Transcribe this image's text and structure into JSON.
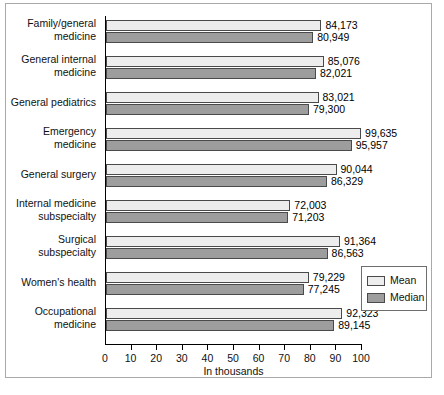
{
  "figure": {
    "x_axis_title": "In thousands",
    "legend": {
      "mean_label": "Mean",
      "median_label": "Median"
    },
    "colors": {
      "mean": "#ededed",
      "median": "#9d9d9d",
      "axis": "#000000",
      "border": "#a9a9a9"
    }
  },
  "chart_data": {
    "type": "bar",
    "orientation": "horizontal",
    "title": "",
    "xlabel": "In thousands",
    "ylabel": "",
    "xlim": [
      0,
      100
    ],
    "xticks": [
      0,
      10,
      20,
      30,
      40,
      50,
      60,
      70,
      80,
      90,
      100
    ],
    "xtick_labels": [
      "0",
      "10",
      "20",
      "30",
      "40",
      "50",
      "60",
      "70",
      "80",
      "90",
      "100"
    ],
    "grid": false,
    "legend_position": "right-lower",
    "units": "thousands of dollars",
    "categories": [
      "Family/general medicine",
      "General internal medicine",
      "General pediatrics",
      "Emergency medicine",
      "General surgery",
      "Internal medicine subspecialty",
      "Surgical subspecialty",
      "Women's health",
      "Occupational medicine"
    ],
    "category_lines": [
      [
        "Family/general",
        "medicine"
      ],
      [
        "General internal",
        "medicine"
      ],
      [
        "General pediatrics"
      ],
      [
        "Emergency",
        "medicine"
      ],
      [
        "General surgery"
      ],
      [
        "Internal medicine",
        "subspecialty"
      ],
      [
        "Surgical",
        "subspecialty"
      ],
      [
        "Women's health"
      ],
      [
        "Occupational",
        "medicine"
      ]
    ],
    "series": [
      {
        "name": "Mean",
        "values": [
          84173,
          85076,
          83021,
          99635,
          90044,
          72003,
          91364,
          79229,
          92323
        ],
        "labels": [
          "84,173",
          "85,076",
          "83,021",
          "99,635",
          "90,044",
          "72,003",
          "91,364",
          "79,229",
          "92,323"
        ]
      },
      {
        "name": "Median",
        "values": [
          80949,
          82021,
          79300,
          95957,
          86329,
          71203,
          86563,
          77245,
          89145
        ],
        "labels": [
          "80,949",
          "82,021",
          "79,300",
          "95,957",
          "86,329",
          "71,203",
          "86,563",
          "77,245",
          "89,145"
        ]
      }
    ]
  }
}
